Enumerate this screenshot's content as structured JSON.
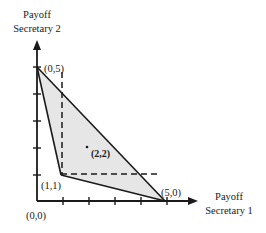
{
  "diagram": {
    "y_axis": {
      "title_line1": "Payoff",
      "title_line2": "Secretary 2",
      "ticks": [
        0,
        1,
        2,
        3,
        4,
        5
      ]
    },
    "x_axis": {
      "title_line1": "Payoff",
      "title_line2": "Secretary 1",
      "ticks": [
        0,
        1,
        2,
        3,
        4,
        5
      ]
    },
    "origin_label": "(0,0)",
    "points": [
      {
        "id": "p05",
        "label": "(0,5)"
      },
      {
        "id": "p11",
        "label": "(1,1)"
      },
      {
        "id": "p50",
        "label": "(5,0)"
      },
      {
        "id": "p22",
        "label": "(2,2)"
      }
    ],
    "colors": {
      "line": "#1a1a1a",
      "region_fill": "#e6e6e6",
      "background": "#ffffff"
    }
  }
}
